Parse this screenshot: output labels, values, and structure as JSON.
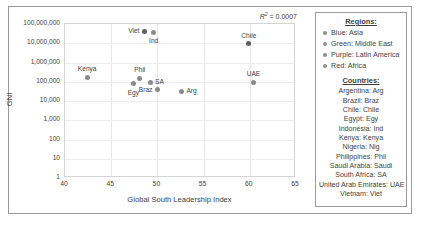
{
  "chart_data": {
    "type": "scatter",
    "title": "",
    "xlabel": "Global South Leadership Index",
    "ylabel": "GNI",
    "xlim": [
      40,
      65
    ],
    "ylim": [
      1,
      100000000
    ],
    "yscale": "log",
    "grid": true,
    "annotation": "R² = 0.0007",
    "annotation_prefix": "R",
    "annotation_sup": "2",
    "annotation_suffix": " = 0.0007",
    "xticks": [
      40,
      45,
      50,
      55,
      60,
      65
    ],
    "yticks": [
      1,
      10,
      100,
      1000,
      10000,
      100000,
      1000000,
      10000000,
      100000000
    ],
    "ytick_labels": [
      "1",
      "10",
      "100",
      "1,000",
      "10,000",
      "100,000",
      "1,000,000",
      "10,000,000",
      "100,000,000"
    ],
    "trendline": {
      "type": "linear-flat",
      "style": "dotted",
      "y": 10000000
    },
    "points": [
      {
        "label": "Viet",
        "x": 48.6,
        "y": 42000000,
        "label_pos": "left"
      },
      {
        "label": "Ind",
        "x": 49.6,
        "y": 38000000,
        "label_pos": "below"
      },
      {
        "label": "Chile",
        "x": 59.9,
        "y": 9500000,
        "label_pos": "above"
      },
      {
        "label": "Kenya",
        "x": 42.4,
        "y": 170000,
        "label_pos": "above"
      },
      {
        "label": "Phil",
        "x": 48.1,
        "y": 150000,
        "label_pos": "above"
      },
      {
        "label": "SA",
        "x": 49.2,
        "y": 95000,
        "label_pos": "right"
      },
      {
        "label": "Egy",
        "x": 47.4,
        "y": 80000,
        "label_pos": "below"
      },
      {
        "label": "Braz",
        "x": 50.0,
        "y": 38000,
        "label_pos": "left"
      },
      {
        "label": "Arg",
        "x": 52.6,
        "y": 33000,
        "label_pos": "right"
      },
      {
        "label": "UAE",
        "x": 60.4,
        "y": 95000,
        "label_pos": "above"
      }
    ]
  },
  "legend": {
    "regions_heading": "Regions:",
    "regions": [
      {
        "label": "Blue: Asia"
      },
      {
        "label": "Green: Middle East"
      },
      {
        "label": "Purple: Latin America"
      },
      {
        "label": "Red: Africa"
      }
    ],
    "countries_heading": "Countries:",
    "countries": [
      "Argentina: Arg",
      "Brazil: Braz",
      "Chile: Chile",
      "Egypt: Egy",
      "Indonesia: Ind",
      "Kenya: Kenya",
      "Nigeria: Nig",
      "Philippines: Phil",
      "Saudi Arabia: Saudi",
      "South Africa: SA",
      "United Arab Emirates: UAE",
      "Vietnam: Viet"
    ]
  }
}
